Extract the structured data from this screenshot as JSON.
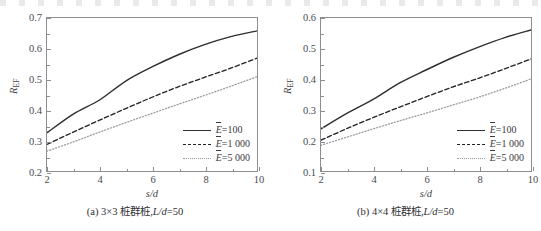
{
  "figure": {
    "panels": [
      {
        "id": "a",
        "caption_prefix": "(a)",
        "caption_grid": "3×3",
        "caption_text": "桩群桩,",
        "caption_italic": "L/d",
        "caption_value": "=50",
        "caption_full": "(a) 3×3 桩群桩,L/d=50",
        "xlabel": "s/d",
        "ylabel_base": "R",
        "ylabel_sub": "EF",
        "yticks": [
          "0.2",
          "0.3",
          "0.4",
          "0.5",
          "0.6",
          "0.7"
        ],
        "xticks": [
          "2",
          "4",
          "6",
          "8",
          "10"
        ],
        "legend": [
          {
            "style": "solid",
            "label": "=100",
            "symbol": "E"
          },
          {
            "style": "dashed",
            "label": "=1 000",
            "symbol": "E"
          },
          {
            "style": "dotted",
            "label": "=5 000",
            "symbol": "E"
          }
        ]
      },
      {
        "id": "b",
        "caption_prefix": "(b)",
        "caption_grid": "4×4",
        "caption_text": "桩群桩,",
        "caption_italic": "L/d",
        "caption_value": "=50",
        "caption_full": "(b) 4×4 桩群桩,L/d=50",
        "xlabel": "s/d",
        "ylabel_base": "R",
        "ylabel_sub": "EF",
        "yticks": [
          "0.1",
          "0.2",
          "0.3",
          "0.4",
          "0.5",
          "0.6"
        ],
        "xticks": [
          "2",
          "4",
          "6",
          "8",
          "10"
        ],
        "legend": [
          {
            "style": "solid",
            "label": "=100",
            "symbol": "E"
          },
          {
            "style": "dashed",
            "label": "=1 000",
            "symbol": "E"
          },
          {
            "style": "dotted",
            "label": "=5 000",
            "symbol": "E"
          }
        ]
      }
    ]
  },
  "colors": {
    "solid": "#2f2f33",
    "dashed": "#232327",
    "dotted": "#9a9aa0",
    "frame": "#8d8d92",
    "background": "#ffffff"
  },
  "chart_data": [
    {
      "type": "line",
      "panel": "a",
      "title": "(a) 3×3 桩群桩,L/d=50",
      "xlabel": "s/d",
      "ylabel": "R_EF",
      "xlim": [
        2,
        10
      ],
      "ylim": [
        0.2,
        0.7
      ],
      "xticks": [
        2,
        4,
        6,
        8,
        10
      ],
      "yticks": [
        0.2,
        0.3,
        0.4,
        0.5,
        0.6,
        0.7
      ],
      "grid": false,
      "legend_position": "lower right",
      "x": [
        2,
        3,
        4,
        5,
        6,
        7,
        8,
        9,
        10
      ],
      "series": [
        {
          "name": "E=100",
          "style": "solid",
          "values": [
            0.325,
            0.386,
            0.432,
            0.494,
            0.54,
            0.58,
            0.613,
            0.639,
            0.658
          ]
        },
        {
          "name": "E=1 000",
          "style": "dashed",
          "values": [
            0.287,
            0.327,
            0.366,
            0.404,
            0.441,
            0.475,
            0.506,
            0.536,
            0.569
          ]
        },
        {
          "name": "E=5 000",
          "style": "dotted",
          "values": [
            0.265,
            0.295,
            0.327,
            0.358,
            0.388,
            0.418,
            0.447,
            0.477,
            0.508
          ]
        }
      ]
    },
    {
      "type": "line",
      "panel": "b",
      "title": "(b) 4×4 桩群桩,L/d=50",
      "xlabel": "s/d",
      "ylabel": "R_EF",
      "xlim": [
        2,
        10
      ],
      "ylim": [
        0.1,
        0.6
      ],
      "xticks": [
        2,
        4,
        6,
        8,
        10
      ],
      "yticks": [
        0.1,
        0.2,
        0.3,
        0.4,
        0.5,
        0.6
      ],
      "grid": false,
      "legend_position": "lower right",
      "x": [
        2,
        3,
        4,
        5,
        6,
        7,
        8,
        9,
        10
      ],
      "series": [
        {
          "name": "E=100",
          "style": "solid",
          "values": [
            0.238,
            0.289,
            0.335,
            0.388,
            0.43,
            0.47,
            0.505,
            0.536,
            0.561
          ]
        },
        {
          "name": "E=1 000",
          "style": "dashed",
          "values": [
            0.201,
            0.239,
            0.275,
            0.309,
            0.342,
            0.374,
            0.403,
            0.434,
            0.466
          ]
        },
        {
          "name": "E=5 000",
          "style": "dotted",
          "values": [
            0.184,
            0.211,
            0.238,
            0.264,
            0.289,
            0.315,
            0.341,
            0.37,
            0.401
          ]
        }
      ]
    }
  ]
}
